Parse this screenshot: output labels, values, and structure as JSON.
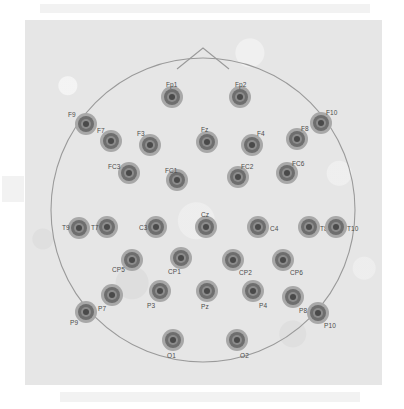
{
  "figure": {
    "view": "top-down head map, nose at top",
    "electrode_count": 32,
    "colors": {
      "page_background": "#ffffff",
      "panel_background": "#e6e6e6",
      "head_outline": "#9a9a9a",
      "electrode_outer_ring": "#a8a8a8",
      "electrode_mid_ring": "#6e6e6e",
      "electrode_inner_ring": "#8c8c8c",
      "electrode_core": "#4a4a4a",
      "label_text": "#4d4d4d"
    }
  },
  "head": {
    "outline_shape": "circle",
    "nose_marker": "triangle-apex-top",
    "cx": 178,
    "cy": 190,
    "r": 152
  },
  "electrodes": [
    {
      "label": "Fp1",
      "x": 147,
      "y": 77,
      "lx": 141,
      "ly": 62
    },
    {
      "label": "Fp2",
      "x": 215,
      "y": 77,
      "lx": 210,
      "ly": 62
    },
    {
      "label": "F9",
      "x": 61,
      "y": 104,
      "lx": 43,
      "ly": 92
    },
    {
      "label": "F7",
      "x": 86,
      "y": 121,
      "lx": 72,
      "ly": 108
    },
    {
      "label": "F3",
      "x": 125,
      "y": 125,
      "lx": 112,
      "ly": 111
    },
    {
      "label": "Fz",
      "x": 182,
      "y": 122,
      "lx": 176,
      "ly": 107
    },
    {
      "label": "F4",
      "x": 227,
      "y": 125,
      "lx": 232,
      "ly": 111
    },
    {
      "label": "F8",
      "x": 272,
      "y": 119,
      "lx": 276,
      "ly": 106
    },
    {
      "label": "F10",
      "x": 296,
      "y": 103,
      "lx": 301,
      "ly": 90
    },
    {
      "label": "FC3",
      "x": 104,
      "y": 153,
      "lx": 83,
      "ly": 144
    },
    {
      "label": "FC1",
      "x": 152,
      "y": 160,
      "lx": 140,
      "ly": 148
    },
    {
      "label": "FC2",
      "x": 213,
      "y": 157,
      "lx": 216,
      "ly": 144
    },
    {
      "label": "FC6",
      "x": 262,
      "y": 153,
      "lx": 267,
      "ly": 141
    },
    {
      "label": "T9",
      "x": 54,
      "y": 208,
      "lx": 37,
      "ly": 205
    },
    {
      "label": "T7",
      "x": 82,
      "y": 207,
      "lx": 66,
      "ly": 205
    },
    {
      "label": "C3",
      "x": 131,
      "y": 207,
      "lx": 114,
      "ly": 205
    },
    {
      "label": "Cz",
      "x": 181,
      "y": 207,
      "lx": 176,
      "ly": 192
    },
    {
      "label": "C4",
      "x": 233,
      "y": 207,
      "lx": 245,
      "ly": 206
    },
    {
      "label": "T8",
      "x": 284,
      "y": 207,
      "lx": 295,
      "ly": 206
    },
    {
      "label": "T10",
      "x": 311,
      "y": 207,
      "lx": 322,
      "ly": 206
    },
    {
      "label": "CP5",
      "x": 107,
      "y": 240,
      "lx": 87,
      "ly": 247
    },
    {
      "label": "CP1",
      "x": 156,
      "y": 238,
      "lx": 143,
      "ly": 249
    },
    {
      "label": "CP2",
      "x": 208,
      "y": 240,
      "lx": 214,
      "ly": 250
    },
    {
      "label": "CP6",
      "x": 258,
      "y": 240,
      "lx": 265,
      "ly": 250
    },
    {
      "label": "P9",
      "x": 61,
      "y": 292,
      "lx": 45,
      "ly": 300
    },
    {
      "label": "P7",
      "x": 87,
      "y": 275,
      "lx": 73,
      "ly": 286
    },
    {
      "label": "P3",
      "x": 135,
      "y": 271,
      "lx": 122,
      "ly": 283
    },
    {
      "label": "Pz",
      "x": 182,
      "y": 271,
      "lx": 176,
      "ly": 284
    },
    {
      "label": "P4",
      "x": 228,
      "y": 271,
      "lx": 234,
      "ly": 283
    },
    {
      "label": "P8",
      "x": 268,
      "y": 277,
      "lx": 274,
      "ly": 288
    },
    {
      "label": "P10",
      "x": 293,
      "y": 293,
      "lx": 299,
      "ly": 303
    },
    {
      "label": "O1",
      "x": 148,
      "y": 320,
      "lx": 142,
      "ly": 333
    },
    {
      "label": "O2",
      "x": 212,
      "y": 320,
      "lx": 215,
      "ly": 333
    }
  ]
}
